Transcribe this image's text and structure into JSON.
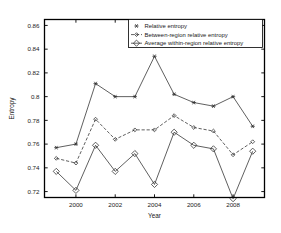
{
  "chart_data": {
    "type": "line",
    "title": "",
    "xlabel": "Year",
    "ylabel": "Entropy",
    "x": [
      1999,
      2000,
      2001,
      2002,
      2003,
      2004,
      2005,
      2006,
      2007,
      2008,
      2009
    ],
    "xlim": [
      1998.4,
      2009.6
    ],
    "ylim": [
      0.715,
      0.865
    ],
    "xticks": [
      2000,
      2002,
      2004,
      2006,
      2008
    ],
    "xtick_labels": [
      "2000",
      "2002",
      "2004",
      "2006",
      "2008"
    ],
    "yticks": [
      0.72,
      0.74,
      0.76,
      0.78,
      0.8,
      0.82,
      0.84,
      0.86
    ],
    "ytick_labels": [
      "0.72",
      "0.74",
      "0.76",
      "0.78",
      "0.8",
      "0.82",
      "0.84",
      "0.86"
    ],
    "grid": false,
    "legend_position": "top-right",
    "series": [
      {
        "name": "Relative entropy",
        "marker": "star",
        "linestyle": "solid",
        "color": "#2b2b2b",
        "values": [
          0.757,
          0.76,
          0.811,
          0.8,
          0.8,
          0.834,
          0.802,
          0.795,
          0.792,
          0.8,
          0.775
        ]
      },
      {
        "name": "Between-region relative entropy",
        "marker": "diamond-small",
        "linestyle": "dashed",
        "color": "#2b2b2b",
        "values": [
          0.748,
          0.744,
          0.781,
          0.764,
          0.772,
          0.772,
          0.784,
          0.774,
          0.771,
          0.751,
          0.762
        ]
      },
      {
        "name": "Average within-region relative entropy",
        "marker": "diamond",
        "linestyle": "solid",
        "color": "#2b2b2b",
        "values": [
          0.737,
          0.721,
          0.759,
          0.737,
          0.752,
          0.726,
          0.77,
          0.759,
          0.756,
          0.714,
          0.754
        ]
      }
    ]
  },
  "axes": {
    "x_title": "Year",
    "y_title": "Entropy"
  },
  "legend": {
    "entries": [
      {
        "label": "Relative entropy"
      },
      {
        "label": "Between-region relative entropy"
      },
      {
        "label": "Average within-region relative entropy"
      }
    ]
  }
}
